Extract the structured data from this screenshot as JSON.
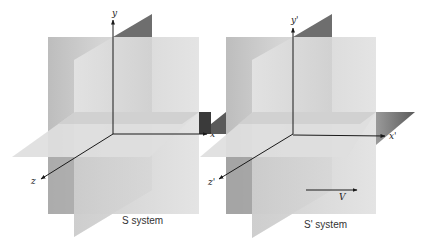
{
  "figure": {
    "systems": [
      {
        "id": "S",
        "caption": "S system",
        "axes": {
          "x": "x",
          "y": "y",
          "z": "z"
        }
      },
      {
        "id": "S-prime",
        "caption": "S' system",
        "axes": {
          "x": "x'",
          "y": "y'",
          "z": "z'"
        },
        "velocity_label": "V"
      }
    ],
    "colors": {
      "background": "#ffffff",
      "back_plane": "#c8c8c8",
      "slant_plane": "#dcdcdc",
      "horizontal_plane": "#e2e2e2",
      "dark_wedge": "#555555",
      "axis": "#1a1a1a"
    }
  }
}
